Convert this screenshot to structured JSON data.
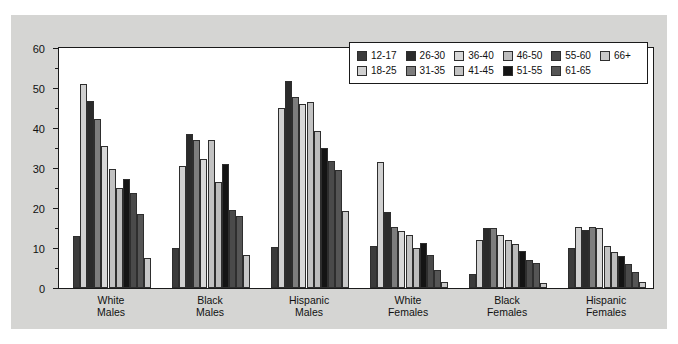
{
  "chart_data": {
    "type": "bar",
    "title": "",
    "xlabel": "",
    "ylabel": "Cumulative probability",
    "ylim": [
      0,
      60
    ],
    "ytick_labels": [
      "0",
      "10",
      "20",
      "30",
      "40",
      "50",
      "60"
    ],
    "ytick_values": [
      0,
      10,
      20,
      30,
      40,
      50,
      60
    ],
    "yminor_values": [
      5,
      15,
      25,
      35,
      45,
      55
    ],
    "grid": false,
    "legend_position": "top-right-inside",
    "categories": [
      "White Males",
      "Black Males",
      "Hispanic Males",
      "White Females",
      "Black Females",
      "Hispanic Females"
    ],
    "category_lines": [
      [
        "White",
        "Males"
      ],
      [
        "Black",
        "Males"
      ],
      [
        "Hispanic",
        "Males"
      ],
      [
        "White",
        "Females"
      ],
      [
        "Black",
        "Females"
      ],
      [
        "Hispanic",
        "Females"
      ]
    ],
    "series": [
      {
        "name": "12-17",
        "color": "#3b3b3b",
        "values": [
          13.0,
          10.0,
          10.2,
          10.4,
          3.4,
          9.9
        ]
      },
      {
        "name": "18-25",
        "color": "#d0d0d0",
        "values": [
          50.9,
          30.6,
          44.9,
          31.5,
          12.0,
          15.3
        ]
      },
      {
        "name": "26-30",
        "color": "#2b2b2b",
        "values": [
          46.8,
          38.5,
          51.8,
          18.9,
          14.9,
          14.6
        ]
      },
      {
        "name": "31-35",
        "color": "#7d7d7d",
        "values": [
          42.3,
          37.1,
          47.7,
          15.3,
          14.9,
          15.2
        ]
      },
      {
        "name": "36-40",
        "color": "#d8d8d8",
        "values": [
          35.6,
          32.3,
          45.9,
          14.3,
          13.2,
          15.1
        ]
      },
      {
        "name": "41-45",
        "color": "#c2c2c2",
        "values": [
          29.8,
          37.1,
          46.5,
          13.2,
          12.0,
          10.5
        ]
      },
      {
        "name": "46-50",
        "color": "#bcbcbc",
        "values": [
          25.1,
          26.4,
          39.2,
          10.1,
          11.0,
          9.1
        ]
      },
      {
        "name": "51-55",
        "color": "#141414",
        "values": [
          27.2,
          31.1,
          35.0,
          11.2,
          9.3,
          7.9
        ]
      },
      {
        "name": "55-60",
        "color": "#4a4a4a",
        "values": [
          23.8,
          19.6,
          31.8,
          8.2,
          6.9,
          6.0
        ]
      },
      {
        "name": "61-65",
        "color": "#555555",
        "values": [
          18.6,
          17.9,
          29.4,
          4.5,
          6.3,
          4.0
        ]
      },
      {
        "name": "66+",
        "color": "#c8c8c8",
        "values": [
          7.4,
          8.3,
          19.2,
          1.5,
          1.3,
          1.6
        ]
      }
    ]
  },
  "legend": {
    "rows": [
      [
        {
          "label": "12-17",
          "color": "#3b3b3b"
        },
        {
          "label": "26-30",
          "color": "#2b2b2b"
        },
        {
          "label": "36-40",
          "color": "#d8d8d8"
        },
        {
          "label": "46-50",
          "color": "#bcbcbc"
        },
        {
          "label": "55-60",
          "color": "#4a4a4a"
        },
        {
          "label": "66+",
          "color": "#c8c8c8"
        }
      ],
      [
        {
          "label": "18-25",
          "color": "#d0d0d0"
        },
        {
          "label": "31-35",
          "color": "#7d7d7d"
        },
        {
          "label": "41-45",
          "color": "#c2c2c2"
        },
        {
          "label": "51-55",
          "color": "#141414"
        },
        {
          "label": "61-65",
          "color": "#555555"
        }
      ]
    ]
  }
}
